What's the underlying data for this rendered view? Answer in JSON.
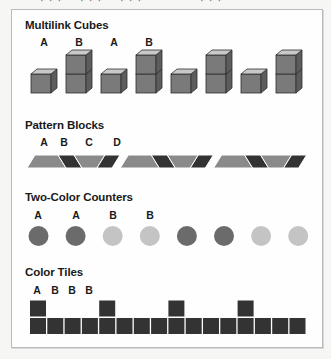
{
  "header": {
    "cutoff_text": "· · ·"
  },
  "sections": {
    "cubes": {
      "title": "Multilink Cubes",
      "labels": [
        "A",
        "B",
        "A",
        "B"
      ],
      "pattern": [
        1,
        2,
        1,
        2,
        1,
        2,
        1,
        2
      ],
      "colors": {
        "front": "#7a7a7a",
        "top": "#c9c9c9",
        "side": "#5c5c5c",
        "edge": "#2e2e2e"
      }
    },
    "pattern_blocks": {
      "title": "Pattern Blocks",
      "labels": [
        "A",
        "B",
        "C",
        "D"
      ],
      "sequence": [
        "A",
        "B",
        "C",
        "D",
        "A",
        "B",
        "C",
        "D",
        "A",
        "B",
        "C",
        "D"
      ],
      "colors": {
        "trapezoid": "#8a8a8a",
        "rhombus": "#333333",
        "edge": "#ffffff"
      }
    },
    "counters": {
      "title": "Two-Color Counters",
      "labels": [
        "A",
        "A",
        "B",
        "B"
      ],
      "sequence": [
        "A",
        "A",
        "B",
        "B",
        "A",
        "A",
        "B",
        "B"
      ],
      "colors": {
        "A": "#6b6b6b",
        "B": "#c4c4c4"
      }
    },
    "tiles": {
      "title": "Color Tiles",
      "labels": [
        "A",
        "B",
        "B",
        "B"
      ],
      "bottom_count": 16,
      "top_positions": [
        0,
        4,
        8,
        12
      ],
      "colors": {
        "tile": "#333333"
      }
    }
  }
}
